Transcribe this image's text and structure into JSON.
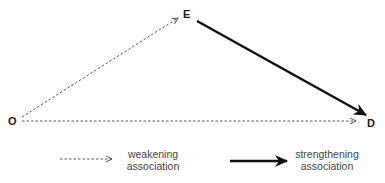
{
  "nodes": {
    "O": {
      "label": "O"
    },
    "E": {
      "label": "E"
    },
    "D": {
      "label": "D"
    }
  },
  "edges": [
    {
      "from": "O",
      "to": "E",
      "style": "dashed",
      "meaning": "weakening association"
    },
    {
      "from": "O",
      "to": "D",
      "style": "dashed",
      "meaning": "weakening association"
    },
    {
      "from": "E",
      "to": "D",
      "style": "solid-thick",
      "meaning": "strengthening association"
    }
  ],
  "legend": {
    "weakening": {
      "line1": "weakening",
      "line2": "association"
    },
    "strengthening": {
      "line1": "strengthening",
      "line2": "association"
    }
  },
  "colors": {
    "dashed": "#555555",
    "solid": "#111111"
  }
}
